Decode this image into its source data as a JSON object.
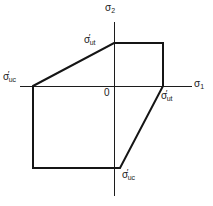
{
  "figure": {
    "kind": "biaxial-failure-envelope",
    "background_color": "#ffffff",
    "line_color": "#151515",
    "axis_color": "#1c1c1c"
  },
  "axes": {
    "horizontal": {
      "name": "sigma-1-axis",
      "label_base": "σ",
      "label_sub": "1",
      "label_full": "σ₁"
    },
    "vertical": {
      "name": "sigma-2-axis",
      "label_base": "σ",
      "label_sub": "2",
      "label_full": "σ₂"
    },
    "origin_label": "0"
  },
  "annotations": [
    {
      "id": "sigma-ut-top",
      "base": "σ",
      "prime": "′",
      "sub": "ut",
      "full": "σ′ut",
      "meaning": "ultimate tensile strength on sigma-2 axis"
    },
    {
      "id": "sigma-uc-left",
      "base": "σ",
      "prime": "′",
      "sub": "uc",
      "full": "σ′uc",
      "meaning": "ultimate compressive strength on negative sigma-1 axis"
    },
    {
      "id": "sigma-ut-right",
      "base": "σ",
      "prime": "′",
      "sub": "ut",
      "full": "σ′ut",
      "meaning": "ultimate tensile strength on positive sigma-1 axis"
    },
    {
      "id": "sigma-uc-bottom",
      "base": "σ",
      "prime": "′",
      "sub": "uc",
      "full": "σ′uc",
      "meaning": "ultimate compressive strength on negative sigma-2 axis"
    }
  ],
  "chart_data": {
    "type": "line",
    "title": "",
    "xlabel": "σ₁",
    "ylabel": "σ₂",
    "grid": false,
    "legend": "none",
    "origin_px": [
      114,
      86
    ],
    "xlim_px": [
      20,
      192
    ],
    "ylim_px": [
      22,
      196
    ],
    "axis_segments": [
      {
        "name": "sigma-1-axis",
        "x1": 20,
        "y1": 86,
        "x2": 192,
        "y2": 86
      },
      {
        "name": "sigma-2-axis",
        "x1": 114,
        "y1": 22,
        "x2": 114,
        "y2": 196
      }
    ],
    "series": [
      {
        "name": "failure-envelope",
        "closed": true,
        "points_px": [
          [
            33,
            86
          ],
          [
            114,
            43
          ],
          [
            163,
            43
          ],
          [
            163,
            86
          ],
          [
            120,
            168
          ],
          [
            33,
            168
          ]
        ],
        "vertex_labels": [
          "σ′uc",
          "σ′ut",
          "",
          "σ′ut",
          "σ′uc",
          ""
        ]
      }
    ],
    "path_d": "M 33 86 L 114 43 L 163 43 L 163 86 L 120 168 L 33 168 Z"
  }
}
